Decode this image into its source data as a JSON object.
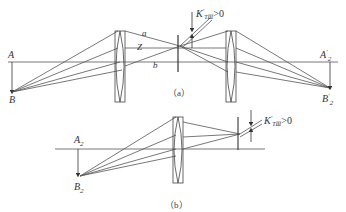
{
  "figure_a": {
    "caption": "（a）",
    "labels": {
      "A": "A",
      "B": "B",
      "a": "a",
      "Z": "Z",
      "b": "b",
      "K": "K",
      "K_sub": "TⅢ",
      "K_rel": ">0",
      "A2p": "A",
      "A2p_sub": "2",
      "B2p": "B",
      "B2p_sub": "2"
    }
  },
  "figure_b": {
    "caption": "（b）",
    "labels": {
      "A2": "A",
      "A2_sub": "2",
      "B2": "B",
      "B2_sub": "2",
      "K": "K",
      "K_sub": "TⅢ",
      "K_rel": ">0"
    }
  },
  "colors": {
    "line": "#555555",
    "text": "#333333"
  }
}
